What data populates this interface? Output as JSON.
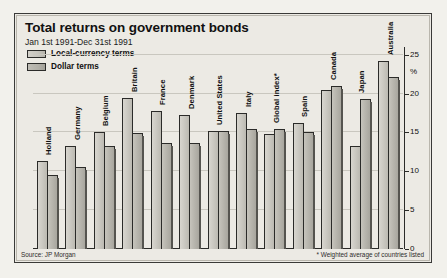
{
  "header": {
    "title": "Total returns on government bonds",
    "subtitle": "Jan 1st 1991-Dec 31st 1991"
  },
  "legend": {
    "items": [
      {
        "label": "Local-currency terms",
        "swatch": "local-currency-swatch",
        "color": "#cdcbc4"
      },
      {
        "label": "Dollar terms",
        "swatch": "dollar-terms-swatch",
        "color": "#b8b6ae"
      }
    ]
  },
  "axis": {
    "unit_label": "%",
    "ticks": [
      "25",
      "20",
      "15",
      "10",
      "5",
      "0"
    ]
  },
  "notes": {
    "source": "Source: JP Morgan",
    "footnote": "* Weighted average of countries listed"
  },
  "chart_data": {
    "type": "bar",
    "title": "Total returns on government bonds",
    "subtitle": "Jan 1st 1991-Dec 31st 1991",
    "xlabel": "",
    "ylabel": "%",
    "ylim": [
      0,
      26
    ],
    "yticks": [
      0,
      5,
      10,
      15,
      20,
      25
    ],
    "grid": true,
    "legend_position": "top-left",
    "categories": [
      "Holland",
      "Germany",
      "Belgium",
      "Britain",
      "France",
      "Denmark",
      "United States",
      "Italy",
      "Global index*",
      "Spain",
      "Canada",
      "Japan",
      "Australia"
    ],
    "series": [
      {
        "name": "Local-currency terms",
        "values": [
          11.3,
          13.3,
          15.0,
          19.4,
          17.8,
          17.3,
          15.2,
          17.5,
          14.8,
          16.2,
          20.5,
          13.3,
          24.2
        ]
      },
      {
        "name": "Dollar terms",
        "values": [
          9.5,
          10.5,
          13.3,
          14.9,
          13.7,
          13.6,
          15.2,
          15.5,
          15.4,
          15.0,
          21.0,
          19.3,
          22.2
        ]
      }
    ],
    "annotations": [
      "Source: JP Morgan",
      "* Weighted average of countries listed"
    ]
  }
}
